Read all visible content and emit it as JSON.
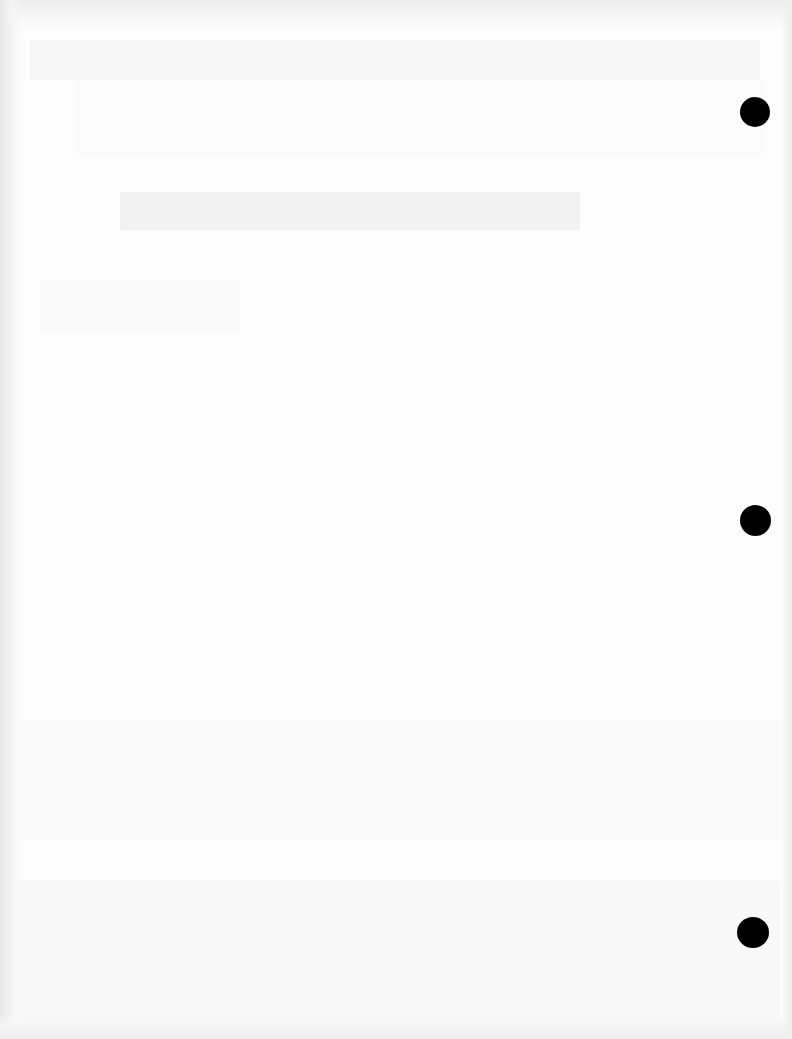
{
  "document": {
    "type": "scanned-page",
    "state": "blank",
    "visible_text": [],
    "note_bleed_through": "",
    "punch_holes": [
      {
        "position": "top-right"
      },
      {
        "position": "middle-right"
      },
      {
        "position": "bottom-right"
      }
    ],
    "colors": {
      "paper": "#fdfdfd",
      "punch_hole": "#000000",
      "edge_shadow": "#ececec"
    }
  }
}
